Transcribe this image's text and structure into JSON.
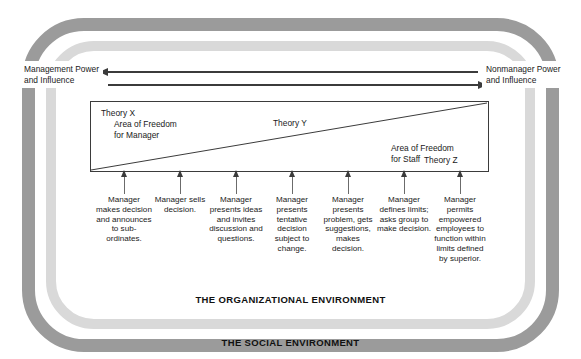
{
  "environments": {
    "social_label": "THE SOCIAL ENVIRONMENT",
    "organizational_label": "THE ORGANIZATIONAL ENVIRONMENT",
    "social_color": "#9b9b9b",
    "organizational_color": "#d9d9d9"
  },
  "power_axis": {
    "left_label": "Management Power and Influence",
    "left_label_line1": "Management Power",
    "left_label_line2": "and Influence",
    "right_label": "Nonmanager Power and Influence",
    "right_label_line1": "Nonmanager Power",
    "right_label_line2": "and Influence",
    "top_arrow_direction": "left",
    "bottom_arrow_direction": "right"
  },
  "continuum": {
    "theory_x": "Theory X",
    "area_freedom_manager_line1": "Area of Freedom",
    "area_freedom_manager_line2": "for Manager",
    "theory_y": "Theory Y",
    "area_freedom_staff_line1": "Area of Freedom",
    "area_freedom_staff_line2": "for Staff",
    "theory_z": "Theory Z"
  },
  "behaviors": [
    {
      "id": 1,
      "text": "Manager makes decision and announces to sub-ordinates.",
      "x": 124
    },
    {
      "id": 2,
      "text": "Manager sells decision.",
      "x": 180
    },
    {
      "id": 3,
      "text": "Manager presents ideas and invites discussion and questions.",
      "x": 236
    },
    {
      "id": 4,
      "text": "Manager presents tentative decision subject to change.",
      "x": 292
    },
    {
      "id": 5,
      "text": "Manager presents problem, gets suggestions, makes decision.",
      "x": 348
    },
    {
      "id": 6,
      "text": "Manager defines limits; asks group to make decision.",
      "x": 404
    },
    {
      "id": 7,
      "text": "Manager permits empowered employees to function within limits defined by superior.",
      "x": 460
    }
  ]
}
